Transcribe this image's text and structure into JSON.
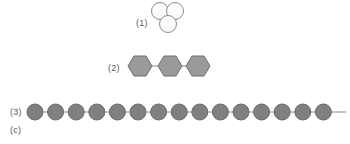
{
  "figure": {
    "panel_label": "(c)",
    "background_color": "#ffffff",
    "width": 350,
    "height": 144
  },
  "items": [
    {
      "id": "trimer-circles",
      "label": "(1)",
      "label_x": 136,
      "label_y": 19,
      "shape": "circle",
      "count": 3,
      "arrangement": "triangle",
      "fill_color": "#fbfbfb",
      "stroke_color": "#8c8c8c",
      "radius": 8.5,
      "stroke_width": 1,
      "group_x": 151,
      "group_y": 2,
      "positions": [
        {
          "cx": 9,
          "cy": 9
        },
        {
          "cx": 24,
          "cy": 9
        },
        {
          "cx": 17,
          "cy": 22
        }
      ]
    },
    {
      "id": "hexagon-chain",
      "label": "(2)",
      "label_x": 108,
      "label_y": 64,
      "shape": "hexagon",
      "count": 3,
      "arrangement": "linear",
      "fill_color": "#9a9a9a",
      "stroke_color": "#6e6e6e",
      "radius": 12,
      "stroke_width": 1,
      "group_x": 126,
      "group_y": 52,
      "bond_color": "#8a8a8a",
      "bond_width": 1,
      "centers_x": [
        14,
        44,
        72
      ],
      "center_y": 14
    },
    {
      "id": "circle-chain",
      "label": "(3)",
      "label_x": 10,
      "label_y": 108,
      "shape": "circle",
      "count": 15,
      "arrangement": "linear",
      "fill_color": "#808080",
      "stroke_color": "#6b6b6b",
      "radius": 8,
      "stroke_width": 1,
      "group_x": 24,
      "group_y": 96,
      "bond_color": "#8a8a8a",
      "bond_width": 1,
      "chain_start_x": 3,
      "chain_end_x": 322,
      "center_y": 16,
      "spacing": 20.6,
      "centers_x": [
        11,
        31.6,
        52.2,
        72.8,
        93.4,
        114,
        134.6,
        155.2,
        175.8,
        196.4,
        217,
        237.6,
        258.2,
        278.8,
        299.4
      ]
    }
  ]
}
